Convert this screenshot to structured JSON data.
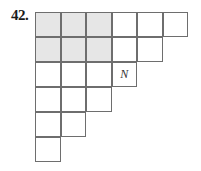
{
  "problem": {
    "number": "42."
  },
  "grid": {
    "cell_width": 25.5,
    "cell_height": 25,
    "shade_color": "#e6e6e6",
    "line_color": "#6e6e6e",
    "rows": [
      {
        "cells": [
          {
            "shaded": true,
            "text": ""
          },
          {
            "shaded": true,
            "text": ""
          },
          {
            "shaded": true,
            "text": ""
          },
          {
            "shaded": false,
            "text": ""
          },
          {
            "shaded": false,
            "text": ""
          },
          {
            "shaded": false,
            "text": ""
          }
        ]
      },
      {
        "cells": [
          {
            "shaded": true,
            "text": ""
          },
          {
            "shaded": true,
            "text": ""
          },
          {
            "shaded": true,
            "text": ""
          },
          {
            "shaded": false,
            "text": ""
          },
          {
            "shaded": false,
            "text": ""
          }
        ]
      },
      {
        "cells": [
          {
            "shaded": false,
            "text": ""
          },
          {
            "shaded": false,
            "text": ""
          },
          {
            "shaded": false,
            "text": ""
          },
          {
            "shaded": false,
            "text": "N"
          }
        ]
      },
      {
        "cells": [
          {
            "shaded": false,
            "text": ""
          },
          {
            "shaded": false,
            "text": ""
          },
          {
            "shaded": false,
            "text": ""
          }
        ]
      },
      {
        "cells": [
          {
            "shaded": false,
            "text": ""
          },
          {
            "shaded": false,
            "text": ""
          }
        ]
      },
      {
        "cells": [
          {
            "shaded": false,
            "text": ""
          }
        ]
      }
    ]
  }
}
